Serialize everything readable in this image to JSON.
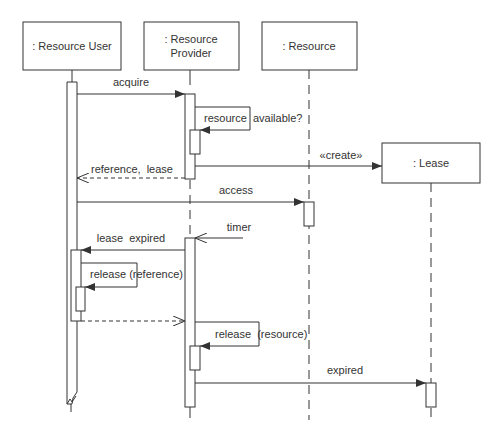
{
  "diagram": {
    "type": "sequence",
    "participants": [
      {
        "id": "user",
        "label_lines": [
          ": Resource User"
        ]
      },
      {
        "id": "provider",
        "label_lines": [
          ": Resource",
          "Provider"
        ]
      },
      {
        "id": "resource",
        "label_lines": [
          ": Resource"
        ]
      },
      {
        "id": "lease",
        "label_lines": [
          ": Lease"
        ]
      }
    ],
    "messages": [
      {
        "id": "acquire",
        "from": "user",
        "to": "provider",
        "label": "acquire",
        "kind": "sync"
      },
      {
        "id": "resource-available",
        "from": "provider",
        "to": "provider",
        "label": "resource  available?",
        "kind": "self"
      },
      {
        "id": "create",
        "from": "provider",
        "to": "lease",
        "label": "«create»",
        "kind": "create"
      },
      {
        "id": "reference-lease",
        "from": "provider",
        "to": "user",
        "label": "reference,  lease",
        "kind": "return"
      },
      {
        "id": "access",
        "from": "user",
        "to": "resource",
        "label": "access",
        "kind": "sync"
      },
      {
        "id": "timer",
        "from": "external",
        "to": "provider",
        "label": "timer",
        "kind": "async"
      },
      {
        "id": "lease-expired",
        "from": "provider",
        "to": "user",
        "label": "lease  expired",
        "kind": "sync"
      },
      {
        "id": "release-reference",
        "from": "user",
        "to": "user",
        "label": "release (reference)",
        "kind": "self"
      },
      {
        "id": "return-to-provider",
        "from": "user",
        "to": "provider",
        "label": "",
        "kind": "return"
      },
      {
        "id": "release-resource",
        "from": "provider",
        "to": "provider",
        "label": "release  (resource)",
        "kind": "self"
      },
      {
        "id": "expired",
        "from": "provider",
        "to": "lease",
        "label": "expired",
        "kind": "sync"
      }
    ]
  }
}
